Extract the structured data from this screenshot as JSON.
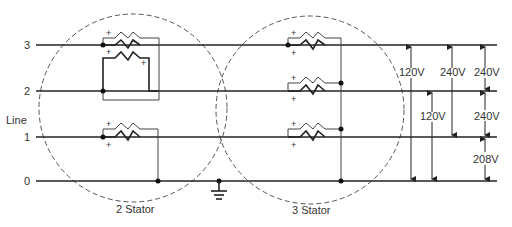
{
  "diagram": {
    "lines": [
      {
        "label": "3",
        "y": 45
      },
      {
        "label": "2",
        "y": 91
      },
      {
        "label": "1",
        "y": 137
      },
      {
        "label": "0",
        "y": 181
      }
    ],
    "line_axis_label": "Line",
    "stators": [
      {
        "label": "2 Stator"
      },
      {
        "label": "3 Stator"
      }
    ],
    "polarity_mark": "+",
    "voltages": [
      {
        "label": "120V",
        "from": "3",
        "to": "0"
      },
      {
        "label": "120V",
        "from": "2",
        "to": "0"
      },
      {
        "label": "240V",
        "from": "3",
        "to": "1"
      },
      {
        "label": "240V",
        "from": "3",
        "to": "2"
      },
      {
        "label": "240V",
        "from": "2",
        "to": "1"
      },
      {
        "label": "208V",
        "from": "1",
        "to": "0"
      }
    ],
    "ground_symbol": "ground"
  },
  "colors": {
    "line": "#222222",
    "text": "#333333",
    "background": "#ffffff"
  }
}
